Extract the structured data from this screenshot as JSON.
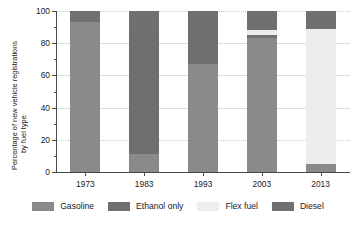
{
  "title_cutoff": "",
  "axes": {
    "ylabel_line1": "Percentage of new vehicle registrations",
    "ylabel_line2": "by fuel type",
    "yticks": [
      "0",
      "20",
      "40",
      "60",
      "80",
      "100"
    ],
    "xticks": [
      "1973",
      "1983",
      "1993",
      "2003",
      "2013"
    ]
  },
  "legend": {
    "items": [
      {
        "label": "Gasoline",
        "color": "#8a8a8a"
      },
      {
        "label": "Ethanol only",
        "color": "#6f6f6f"
      },
      {
        "label": "Flex fuel",
        "color": "#ededed"
      },
      {
        "label": "Diesel",
        "color": "#707070"
      }
    ]
  },
  "chart_data": {
    "type": "bar",
    "stacked": true,
    "normalized_percent": true,
    "title": "",
    "xlabel": "",
    "ylabel": "Percentage of new vehicle registrations by fuel type",
    "ylim": [
      0,
      100
    ],
    "yticks": [
      0,
      20,
      40,
      60,
      80,
      100
    ],
    "grid": true,
    "legend_position": "bottom",
    "categories": [
      "1973",
      "1983",
      "1993",
      "2003",
      "2013"
    ],
    "series": [
      {
        "name": "Gasoline",
        "color": "#8a8a8a",
        "values": [
          93,
          11,
          67,
          83,
          5
        ]
      },
      {
        "name": "Ethanol only",
        "color": "#6f6f6f",
        "values": [
          0,
          80,
          23,
          2,
          0
        ]
      },
      {
        "name": "Flex fuel",
        "color": "#ededed",
        "values": [
          0,
          0,
          0,
          3,
          84
        ]
      },
      {
        "name": "Diesel",
        "color": "#707070",
        "values": [
          7,
          9,
          10,
          12,
          11
        ]
      }
    ]
  }
}
